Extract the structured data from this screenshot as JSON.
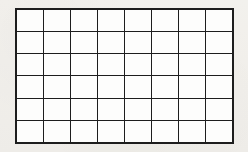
{
  "figure": {
    "kind": "blank-grid",
    "title": "",
    "caption": "",
    "columns": 8,
    "rows": 6,
    "line_color": "#1d1d1d",
    "cell_fill": "#fdfdfc",
    "page_background": "#f7f6f4",
    "cells": [
      [
        "",
        "",
        "",
        "",
        "",
        "",
        "",
        ""
      ],
      [
        "",
        "",
        "",
        "",
        "",
        "",
        "",
        ""
      ],
      [
        "",
        "",
        "",
        "",
        "",
        "",
        "",
        ""
      ],
      [
        "",
        "",
        "",
        "",
        "",
        "",
        "",
        ""
      ],
      [
        "",
        "",
        "",
        "",
        "",
        "",
        "",
        ""
      ],
      [
        "",
        "",
        "",
        "",
        "",
        "",
        "",
        ""
      ]
    ]
  }
}
